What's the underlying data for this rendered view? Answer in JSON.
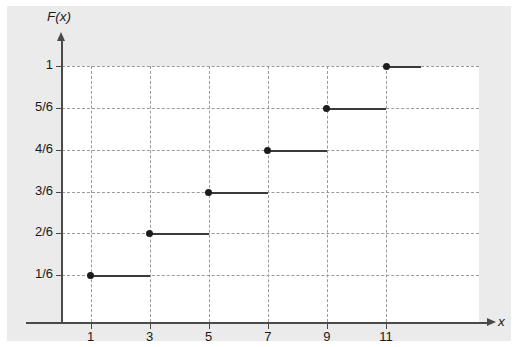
{
  "chart_data": {
    "type": "line",
    "subtype": "step-cdf",
    "title": "",
    "xlabel": "x",
    "ylabel": "F(x)",
    "xlim": [
      0,
      12.4
    ],
    "ylim": [
      0,
      1.0
    ],
    "grid": true,
    "legend": "none",
    "x_ticks": [
      {
        "value": 1,
        "label": "1"
      },
      {
        "value": 3,
        "label": "3"
      },
      {
        "value": 5,
        "label": "5"
      },
      {
        "value": 7,
        "label": "7"
      },
      {
        "value": 9,
        "label": "9"
      },
      {
        "value": 11,
        "label": "11"
      }
    ],
    "y_ticks": [
      {
        "value": 0.16667,
        "label": "1/6"
      },
      {
        "value": 0.33333,
        "label": "2/6"
      },
      {
        "value": 0.5,
        "label": "3/6"
      },
      {
        "value": 0.66667,
        "label": "4/6"
      },
      {
        "value": 0.83333,
        "label": "5/6"
      },
      {
        "value": 1.0,
        "label": "1"
      }
    ],
    "steps": [
      {
        "x_start": 1,
        "x_end": 3,
        "y": 0.16667,
        "y_label": "1/6",
        "dot": "filled-left"
      },
      {
        "x_start": 3,
        "x_end": 5,
        "y": 0.33333,
        "y_label": "2/6",
        "dot": "filled-left"
      },
      {
        "x_start": 5,
        "x_end": 7,
        "y": 0.5,
        "y_label": "3/6",
        "dot": "filled-left"
      },
      {
        "x_start": 7,
        "x_end": 9,
        "y": 0.66667,
        "y_label": "4/6",
        "dot": "filled-left"
      },
      {
        "x_start": 9,
        "x_end": 11,
        "y": 0.83333,
        "y_label": "5/6",
        "dot": "filled-left"
      },
      {
        "x_start": 11,
        "x_end": 12.2,
        "y": 1.0,
        "y_label": "1",
        "dot": "filled-left"
      }
    ]
  },
  "figure": {
    "y_axis_title": "F(x)",
    "x_axis_title": "x",
    "background_color": "#ebebeb",
    "plot_background_color": "#ffffff",
    "line_color": "#3a3a3a",
    "grid_color": "#9a9a9a",
    "axis_color": "#4a4a4a",
    "marker_color": "#1c1c1c"
  }
}
